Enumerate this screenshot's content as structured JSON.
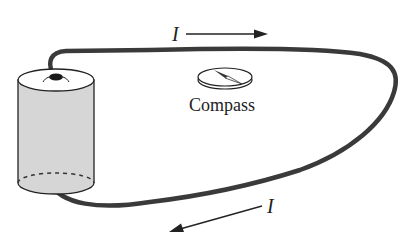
{
  "diagram": {
    "type": "circuit-illustration",
    "labels": {
      "current_top": "I",
      "current_bottom": "I",
      "compass": "Compass"
    },
    "components": [
      {
        "id": "battery",
        "kind": "cylinder-battery"
      },
      {
        "id": "wire",
        "kind": "closed-loop-wire"
      },
      {
        "id": "compass",
        "kind": "compass",
        "label": "Compass"
      }
    ],
    "arrows": [
      {
        "label": "I",
        "direction": "right",
        "position": "above top wire"
      },
      {
        "label": "I",
        "direction": "down-left",
        "position": "below bottom wire"
      }
    ],
    "colors": {
      "wire": "#3a3a3a",
      "battery_fill": "#d6d6d6",
      "outline": "#222222",
      "background": "#ffffff"
    }
  }
}
